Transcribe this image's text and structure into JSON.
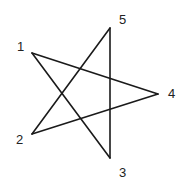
{
  "diagram": {
    "type": "pentagram",
    "stroke_color": "#1a1a1a",
    "background": "#ffffff",
    "vertices": [
      {
        "id": "1",
        "label": "1",
        "x": 32,
        "y": 53,
        "label_x": 17,
        "label_y": 51
      },
      {
        "id": "2",
        "label": "2",
        "x": 32,
        "y": 134,
        "label_x": 16,
        "label_y": 144
      },
      {
        "id": "3",
        "label": "3",
        "x": 110,
        "y": 158,
        "label_x": 119,
        "label_y": 177
      },
      {
        "id": "4",
        "label": "4",
        "x": 158,
        "y": 94,
        "label_x": 168,
        "label_y": 98
      },
      {
        "id": "5",
        "label": "5",
        "x": 110,
        "y": 28,
        "label_x": 119,
        "label_y": 24
      }
    ],
    "edges": [
      [
        "1",
        "3"
      ],
      [
        "3",
        "5"
      ],
      [
        "5",
        "2"
      ],
      [
        "2",
        "4"
      ],
      [
        "4",
        "1"
      ]
    ]
  }
}
